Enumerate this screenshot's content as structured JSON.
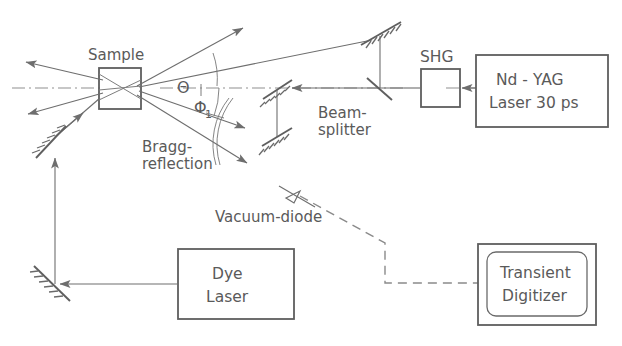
{
  "figure": {
    "background_color": "#ffffff",
    "line_color": "#6e6e6e",
    "text_color": "#5a5a5a",
    "width": 622,
    "height": 346
  },
  "labels": {
    "sample": "Sample",
    "theta": "Θ",
    "phi": "Φ",
    "phi_subscript": "1",
    "bragg_line1": "Bragg-",
    "bragg_line2": "reflection",
    "beamsplitter_line1": "Beam-",
    "beamsplitter_line2": "splitter",
    "shg": "SHG",
    "vacuum_diode": "Vacuum-diode"
  },
  "boxes": {
    "nd_yag": {
      "line1": "Nd - YAG",
      "line2": "Laser 30 ps"
    },
    "shg_crystal": {
      "label": "SHG"
    },
    "dye_laser": {
      "line1": "Dye",
      "line2": "Laser"
    },
    "transient_digitizer": {
      "line1": "Transient",
      "line2": "Digitizer"
    },
    "sample_box": {
      "label": ""
    }
  },
  "components": [
    {
      "name": "nd-yag-laser",
      "type": "source",
      "label": "Nd - YAG Laser 30 ps"
    },
    {
      "name": "shg-crystal",
      "type": "optic",
      "label": "SHG"
    },
    {
      "name": "beam-splitter",
      "type": "optic",
      "label": "Beam-splitter"
    },
    {
      "name": "sample",
      "type": "target",
      "label": "Sample"
    },
    {
      "name": "vacuum-diode",
      "type": "detector",
      "label": "Vacuum-diode"
    },
    {
      "name": "dye-laser",
      "type": "source",
      "label": "Dye Laser"
    },
    {
      "name": "transient-digitizer",
      "type": "instrument",
      "label": "Transient Digitizer"
    }
  ],
  "angles": [
    {
      "name": "theta",
      "symbol": "Θ"
    },
    {
      "name": "phi-1",
      "symbol": "Φ1"
    }
  ]
}
